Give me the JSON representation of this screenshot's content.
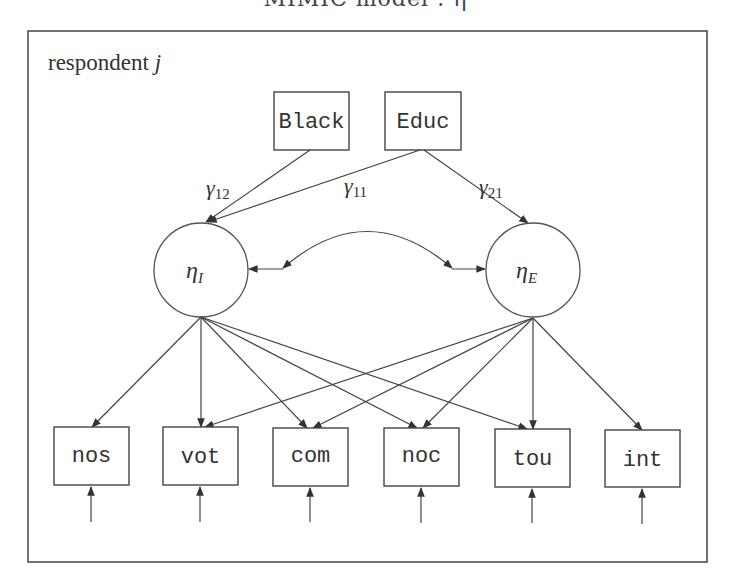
{
  "title": "MIMIC model : η",
  "frame": {
    "label": "respondent j",
    "label_text": "respondent ",
    "label_var": "j"
  },
  "observed_covariates": [
    {
      "id": "black",
      "label": "Black"
    },
    {
      "id": "educ",
      "label": "Educ"
    }
  ],
  "latent_variables": [
    {
      "id": "eta_I",
      "symbol": "η",
      "subscript": "I"
    },
    {
      "id": "eta_E",
      "symbol": "η",
      "subscript": "E"
    }
  ],
  "paths": [
    {
      "from": "Black",
      "to": "eta_I",
      "label": "γ",
      "sub": "12"
    },
    {
      "from": "Educ",
      "to": "eta_I",
      "label": "γ",
      "sub": "11"
    },
    {
      "from": "Educ",
      "to": "eta_E",
      "label": "γ",
      "sub": "21"
    }
  ],
  "covariance": {
    "between": [
      "eta_I",
      "eta_E"
    ],
    "type": "double-headed"
  },
  "indicators": [
    {
      "id": "nos",
      "label": "nos",
      "loads_on": [
        "eta_I"
      ]
    },
    {
      "id": "vot",
      "label": "vot",
      "loads_on": [
        "eta_I",
        "eta_E"
      ]
    },
    {
      "id": "com",
      "label": "com",
      "loads_on": [
        "eta_I",
        "eta_E"
      ]
    },
    {
      "id": "noc",
      "label": "noc",
      "loads_on": [
        "eta_I",
        "eta_E"
      ]
    },
    {
      "id": "tou",
      "label": "tou",
      "loads_on": [
        "eta_I",
        "eta_E"
      ]
    },
    {
      "id": "int",
      "label": "int",
      "loads_on": [
        "eta_E"
      ]
    }
  ],
  "error_terms": {
    "count": 6,
    "note": "one unlabeled error arrow into each indicator"
  },
  "colors": {
    "stroke": "#444444",
    "background": "#ffffff"
  }
}
